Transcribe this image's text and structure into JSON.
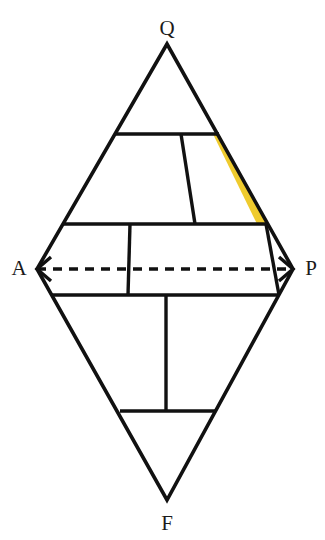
{
  "figure": {
    "type": "qapf-double-triangle",
    "title": "",
    "background_color": "#ffffff",
    "line_color": "#111111",
    "highlight_color": "#efcb2e",
    "highlight_field_name": "",
    "vertices": [
      {
        "id": "Q",
        "label": "Q",
        "x": 167,
        "y": 44,
        "label_x": 167,
        "label_y": 30
      },
      {
        "id": "A",
        "label": "A",
        "x": 37,
        "y": 269,
        "label_x": 19,
        "label_y": 270
      },
      {
        "id": "P",
        "label": "P",
        "x": 293,
        "y": 269,
        "label_x": 311,
        "label_y": 270
      },
      {
        "id": "F",
        "label": "F",
        "x": 167,
        "y": 500,
        "label_x": 167,
        "label_y": 525
      }
    ],
    "outline": {
      "name": "qapf-outline",
      "points": "167,44 293,269 167,500 37,269"
    },
    "axis": {
      "name": "ap-axis-dashed",
      "x1": 37,
      "y1": 269,
      "x2": 293,
      "y2": 269,
      "dash": "9 7"
    },
    "arrows": [
      {
        "name": "arrow-head-a",
        "points": "51,257 37,269 51,281"
      },
      {
        "name": "arrow-head-p",
        "points": "279,257 293,269 279,281"
      }
    ],
    "internal_lines": [
      {
        "name": "q-upper-boundary",
        "x1": 116,
        "y1": 134,
        "x2": 219,
        "y2": 134
      },
      {
        "name": "q-lower-boundary",
        "x1": 62,
        "y1": 224,
        "x2": 268,
        "y2": 224
      },
      {
        "name": "f-upper-boundary",
        "x1": 52,
        "y1": 295,
        "x2": 278,
        "y2": 295
      },
      {
        "name": "f-lower-boundary",
        "x1": 120,
        "y1": 411,
        "x2": 216,
        "y2": 411
      },
      {
        "name": "divider-upper-mid",
        "x1": 181,
        "y1": 134,
        "x2": 195,
        "y2": 224
      },
      {
        "name": "divider-mid-left",
        "x1": 130,
        "y1": 224,
        "x2": 128,
        "y2": 295
      },
      {
        "name": "divider-mid-right",
        "x1": 266,
        "y1": 224,
        "x2": 279,
        "y2": 295
      },
      {
        "name": "divider-lower-center",
        "x1": 166,
        "y1": 295,
        "x2": 166,
        "y2": 411
      }
    ],
    "highlight_polygon": {
      "name": "highlighted-field",
      "points": "213,134 219,134 268,224 257,224"
    }
  }
}
